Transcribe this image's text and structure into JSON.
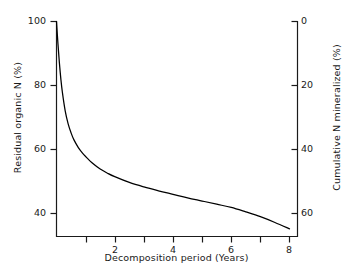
{
  "chart_data": {
    "type": "line",
    "title": "",
    "xlabel": "Decomposition period (Years)",
    "ylabel": "Residual organic N (%)",
    "ylabel_secondary": "Cumulative N mineralized (%)",
    "xlim": [
      0,
      8.3
    ],
    "ylim": [
      33,
      100
    ],
    "ylim_secondary": [
      0,
      67
    ],
    "grid": false,
    "legend": null,
    "xticks": [
      1,
      2,
      3,
      4,
      5,
      6,
      7,
      8
    ],
    "xtick_labels": [
      "",
      "2",
      "",
      "4",
      "",
      "6",
      "",
      "8"
    ],
    "yticks": [
      100,
      80,
      60,
      40
    ],
    "ytick_labels": [
      "100",
      "80",
      "60",
      "40"
    ],
    "yticks_secondary": [
      0,
      20,
      40,
      60
    ],
    "ytick_labels_secondary": [
      "0",
      "20",
      "40",
      "60"
    ],
    "series": [
      {
        "name": "Residual organic N",
        "color": "#000000",
        "x": [
          0.0,
          0.05,
          0.1,
          0.15,
          0.2,
          0.3,
          0.4,
          0.5,
          0.6,
          0.75,
          0.9,
          1.0,
          1.25,
          1.5,
          1.75,
          2.0,
          2.5,
          3.0,
          3.5,
          4.0,
          4.5,
          5.0,
          5.5,
          6.0,
          6.5,
          7.0,
          7.5,
          8.0
        ],
        "y": [
          100.0,
          93.0,
          87.0,
          82.0,
          78.0,
          72.0,
          68.0,
          65.2,
          63.0,
          60.6,
          58.8,
          57.8,
          55.6,
          53.9,
          52.6,
          51.5,
          49.7,
          48.3,
          47.1,
          46.0,
          44.9,
          43.9,
          42.9,
          41.9,
          40.5,
          39.0,
          37.2,
          35.2
        ]
      }
    ],
    "secondary_relation": "cumulative = 100 - residual, plotted 0 at top to 67 at bottom"
  },
  "labels": {
    "y_left": "Residual organic N (%)",
    "y_right": "Cumulative N mineralized (%)",
    "x_axis": "Decomposition period (Years)",
    "left_ticks": [
      "100",
      "80",
      "60",
      "40"
    ],
    "right_ticks": [
      "0",
      "20",
      "40",
      "60"
    ],
    "bottom_ticks": [
      "2",
      "4",
      "6",
      "8"
    ]
  },
  "colors": {
    "background": "#ffffff",
    "axis": "#1a1a1a",
    "curve": "#000000",
    "text": "#1a1a1a"
  }
}
